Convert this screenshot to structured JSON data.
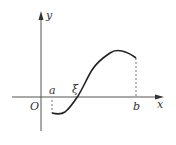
{
  "diagram": {
    "labels": {
      "y_axis": "y",
      "x_axis": "x",
      "origin": "O",
      "a": "a",
      "b": "b",
      "xi": "ξ"
    },
    "colors": {
      "axis": "#555555",
      "curve": "#222222",
      "dashed": "#666666"
    }
  }
}
